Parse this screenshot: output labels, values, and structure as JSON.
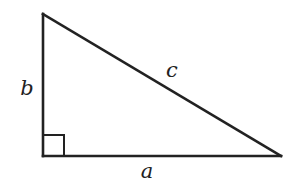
{
  "diagram": {
    "type": "right-triangle",
    "vertices": {
      "top": [
        43,
        14
      ],
      "right_angle": [
        43,
        156
      ],
      "right": [
        281,
        156
      ]
    },
    "right_angle_marker": {
      "x": 43,
      "y": 135,
      "size": 21
    },
    "labels": {
      "a": "a",
      "b": "b",
      "c": "c"
    },
    "label_positions": {
      "a": [
        147,
        178
      ],
      "b": [
        27,
        95
      ],
      "c": [
        172,
        77
      ]
    },
    "colors": {
      "stroke": "#222222",
      "background": "#ffffff"
    }
  }
}
